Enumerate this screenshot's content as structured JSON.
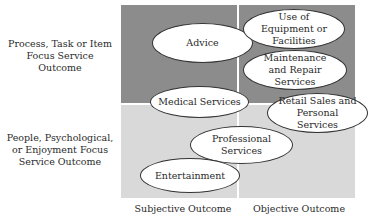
{
  "diagram": {
    "row_labels": [
      "Process, Task or Item Focus Service Outcome",
      "People, Psychological, or Enjoyment Focus Service Outcome"
    ],
    "column_labels": [
      "Subjective Outcome",
      "Objective Outcome"
    ],
    "items": [
      {
        "label": "Advice"
      },
      {
        "label": "Use of Equipment or Facilities"
      },
      {
        "label": "Maintenance and Repair Services"
      },
      {
        "label": "Medical Services"
      },
      {
        "label": "Retail Sales and Personal Services"
      },
      {
        "label": "Professional Services"
      },
      {
        "label": "Entertainment"
      }
    ],
    "colors": {
      "top_quadrants": "#8c8c8c",
      "bottom_quadrants": "#d9d9d9",
      "ellipse_fill": "#ffffff",
      "ellipse_border": "#333333"
    }
  }
}
